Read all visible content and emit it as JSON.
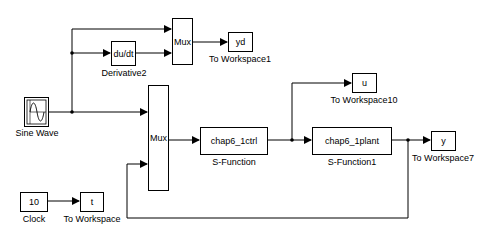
{
  "diagram": {
    "type": "simulink-block-diagram",
    "blocks": [
      {
        "id": "sine",
        "text": "",
        "label": "Sine Wave",
        "icon": "sine-wave-icon"
      },
      {
        "id": "deriv",
        "text": "du/dt",
        "label": "Derivative2"
      },
      {
        "id": "mux1",
        "text": "Mux",
        "label": ""
      },
      {
        "id": "yd",
        "text": "yd",
        "label": "To Workspace1"
      },
      {
        "id": "mux2",
        "text": "Mux",
        "label": ""
      },
      {
        "id": "ctrl",
        "text": "chap6_1ctrl",
        "label": "S-Function"
      },
      {
        "id": "u",
        "text": "u",
        "label": "To Workspace10"
      },
      {
        "id": "plant",
        "text": "chap6_1plant",
        "label": "S-Function1"
      },
      {
        "id": "y",
        "text": "y",
        "label": "To Workspace7"
      },
      {
        "id": "clock",
        "text": "10",
        "label": "Clock"
      },
      {
        "id": "t",
        "text": "t",
        "label": "To Workspace"
      }
    ],
    "connections": [
      {
        "from": "sine",
        "to": "mux1",
        "port": 1
      },
      {
        "from": "sine",
        "to": "deriv",
        "port": 1
      },
      {
        "from": "deriv",
        "to": "mux1",
        "port": 2
      },
      {
        "from": "mux1",
        "to": "yd",
        "port": 1
      },
      {
        "from": "sine",
        "to": "mux2",
        "port": 1
      },
      {
        "from": "plant",
        "to": "mux2",
        "port": 2
      },
      {
        "from": "mux2",
        "to": "ctrl",
        "port": 1
      },
      {
        "from": "ctrl",
        "to": "plant",
        "port": 1
      },
      {
        "from": "ctrl",
        "to": "u",
        "port": 1
      },
      {
        "from": "plant",
        "to": "y",
        "port": 1
      },
      {
        "from": "clock",
        "to": "t",
        "port": 1
      }
    ]
  },
  "colors": {
    "line": "#000000",
    "block_border": "#000000",
    "background": "#ffffff"
  }
}
